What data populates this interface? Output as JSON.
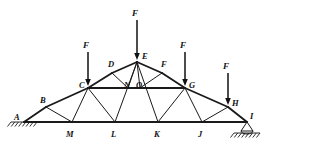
{
  "figure": {
    "type": "truss-structural-diagram",
    "width": 317,
    "height": 152,
    "background_color": "#ffffff",
    "line_color": "#1a1a1a"
  },
  "nodes": [
    {
      "id": "A",
      "label": "A",
      "x": 24,
      "y": 122,
      "label_x": 14,
      "label_y": 113
    },
    {
      "id": "B",
      "label": "B",
      "x": 46,
      "y": 107,
      "label_x": 40,
      "label_y": 96
    },
    {
      "id": "C",
      "label": "C",
      "x": 88,
      "y": 88,
      "label_x": 79,
      "label_y": 81
    },
    {
      "id": "D",
      "label": "D",
      "x": 112,
      "y": 73,
      "label_x": 108,
      "label_y": 60
    },
    {
      "id": "E",
      "label": "E",
      "x": 137,
      "y": 62,
      "label_x": 142,
      "label_y": 52
    },
    {
      "id": "F",
      "label": "F",
      "x": 162,
      "y": 73,
      "label_x": 161,
      "label_y": 60
    },
    {
      "id": "G",
      "label": "G",
      "x": 185,
      "y": 88,
      "label_x": 189,
      "label_y": 81
    },
    {
      "id": "H",
      "label": "H",
      "x": 228,
      "y": 107,
      "label_x": 232,
      "label_y": 99
    },
    {
      "id": "I",
      "label": "I",
      "x": 247,
      "y": 122,
      "label_x": 250,
      "label_y": 112
    },
    {
      "id": "J",
      "label": "J",
      "x": 202,
      "y": 122,
      "label_x": 198,
      "label_y": 130
    },
    {
      "id": "K",
      "label": "K",
      "x": 158,
      "y": 122,
      "label_x": 154,
      "label_y": 130
    },
    {
      "id": "L",
      "label": "L",
      "x": 115,
      "y": 122,
      "label_x": 111,
      "label_y": 130
    },
    {
      "id": "M",
      "label": "M",
      "x": 72,
      "y": 122,
      "label_x": 66,
      "label_y": 130
    },
    {
      "id": "N",
      "label": "N",
      "x": 128,
      "y": 88,
      "label_x": 124,
      "label_y": 81
    },
    {
      "id": "O",
      "label": "O",
      "x": 140,
      "y": 88,
      "label_x": 136,
      "label_y": 81
    }
  ],
  "members": [
    {
      "from": "A",
      "to": "M",
      "kind": "chord"
    },
    {
      "from": "M",
      "to": "L",
      "kind": "chord"
    },
    {
      "from": "L",
      "to": "K",
      "kind": "chord"
    },
    {
      "from": "K",
      "to": "J",
      "kind": "chord"
    },
    {
      "from": "J",
      "to": "I",
      "kind": "chord"
    },
    {
      "from": "A",
      "to": "B",
      "kind": "chord"
    },
    {
      "from": "B",
      "to": "C",
      "kind": "chord"
    },
    {
      "from": "C",
      "to": "D",
      "kind": "chord"
    },
    {
      "from": "D",
      "to": "E",
      "kind": "chord"
    },
    {
      "from": "E",
      "to": "F",
      "kind": "chord"
    },
    {
      "from": "F",
      "to": "G",
      "kind": "chord"
    },
    {
      "from": "G",
      "to": "H",
      "kind": "chord"
    },
    {
      "from": "H",
      "to": "I",
      "kind": "chord"
    },
    {
      "from": "C",
      "to": "N",
      "kind": "tie"
    },
    {
      "from": "N",
      "to": "O",
      "kind": "tie"
    },
    {
      "from": "O",
      "to": "G",
      "kind": "tie"
    },
    {
      "from": "B",
      "to": "M",
      "kind": "web"
    },
    {
      "from": "C",
      "to": "M",
      "kind": "web"
    },
    {
      "from": "C",
      "to": "L",
      "kind": "web"
    },
    {
      "from": "D",
      "to": "N",
      "kind": "web"
    },
    {
      "from": "E",
      "to": "N",
      "kind": "web"
    },
    {
      "from": "E",
      "to": "O",
      "kind": "web"
    },
    {
      "from": "E",
      "to": "L",
      "kind": "web"
    },
    {
      "from": "E",
      "to": "K",
      "kind": "web"
    },
    {
      "from": "F",
      "to": "O",
      "kind": "web"
    },
    {
      "from": "G",
      "to": "K",
      "kind": "web"
    },
    {
      "from": "G",
      "to": "J",
      "kind": "web"
    },
    {
      "from": "H",
      "to": "J",
      "kind": "web"
    }
  ],
  "loads": [
    {
      "id": "load-c",
      "label": "F",
      "at_node": "C",
      "x": 88,
      "tail_y": 52,
      "tip_y": 86,
      "label_x": 83,
      "label_y": 41
    },
    {
      "id": "load-e",
      "label": "F",
      "at_node": "E",
      "x": 137,
      "tail_y": 20,
      "tip_y": 60,
      "label_x": 132,
      "label_y": 9
    },
    {
      "id": "load-g",
      "label": "F",
      "at_node": "G",
      "x": 185,
      "tail_y": 52,
      "tip_y": 86,
      "label_x": 180,
      "label_y": 41
    },
    {
      "id": "load-h",
      "label": "F",
      "at_node": "H",
      "x": 228,
      "tail_y": 73,
      "tip_y": 105,
      "label_x": 223,
      "label_y": 62
    }
  ],
  "supports": [
    {
      "id": "support-a",
      "type": "pin-hatched",
      "at_node": "A",
      "x": 24,
      "y": 122,
      "half_width": 13,
      "hatch_count": 8
    },
    {
      "id": "support-i",
      "type": "roller-triangle-hatched",
      "at_node": "I",
      "x": 247,
      "y": 122,
      "half_width": 13,
      "hatch_count": 8
    }
  ]
}
